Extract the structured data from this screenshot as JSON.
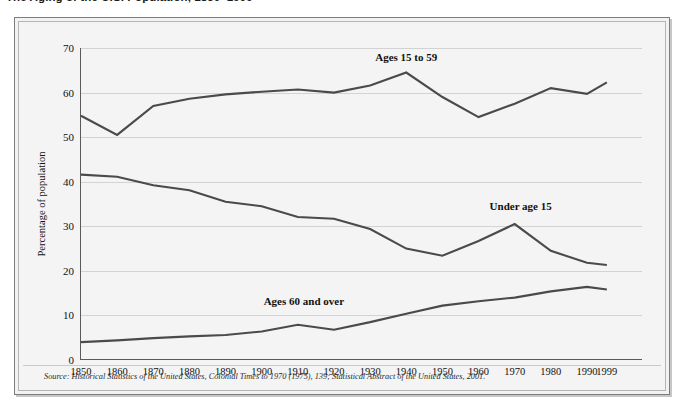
{
  "figure": {
    "title": "The Aging of the U.S. Population, 1850–1999",
    "source_note": "Source: Historical Statistics of the United States, Colonial Times to 1970 (1975), 139; Statistical Abstract of the United States, 2001."
  },
  "axes": {
    "ylabel": "Percentage of population",
    "xlabel": "",
    "yticks": [
      "0",
      "10",
      "20",
      "30",
      "40",
      "50",
      "60",
      "70"
    ],
    "xticks": [
      "1850",
      "1860",
      "1870",
      "1880",
      "1890",
      "1900",
      "1910",
      "1920",
      "1930",
      "1940",
      "1950",
      "1960",
      "1970",
      "1980",
      "1990",
      "1999"
    ]
  },
  "series_labels": {
    "working": "Ages 15 to 59",
    "young": "Under age 15",
    "old": "Ages 60 and over"
  },
  "colors": {
    "line": "#4a4a4a",
    "grid": "#d3d3d3",
    "axis": "#5a5a5a",
    "panel": "#f4f4f4",
    "frame": "#7d7d7d"
  },
  "chart_data": {
    "type": "line",
    "title": "The Aging of the U.S. Population, 1850–1999",
    "xlabel": "",
    "ylabel": "Percentage of population",
    "xlim": [
      1850,
      1999
    ],
    "ylim": [
      0,
      70
    ],
    "grid": true,
    "legend": "inline-labels",
    "x": [
      1850,
      1860,
      1870,
      1880,
      1890,
      1900,
      1910,
      1920,
      1930,
      1940,
      1950,
      1960,
      1970,
      1980,
      1990,
      1999
    ],
    "series": [
      {
        "name": "Ages 15 to 59",
        "values": [
          54.8,
          50.5,
          57.0,
          58.6,
          59.6,
          60.2,
          60.7,
          60.0,
          61.6,
          64.5,
          59.0,
          54.5,
          57.5,
          61.0,
          59.7,
          62.3
        ]
      },
      {
        "name": "Under age 15",
        "values": [
          41.6,
          41.1,
          39.2,
          38.1,
          35.5,
          34.5,
          32.1,
          31.7,
          29.4,
          25.0,
          23.4,
          26.7,
          30.5,
          24.5,
          21.8,
          21.3
        ]
      },
      {
        "name": "Ages 60 and over",
        "values": [
          4.0,
          4.4,
          4.9,
          5.3,
          5.6,
          6.4,
          7.9,
          6.8,
          8.5,
          10.4,
          12.2,
          13.2,
          14.0,
          15.4,
          16.4,
          15.8
        ]
      }
    ]
  }
}
